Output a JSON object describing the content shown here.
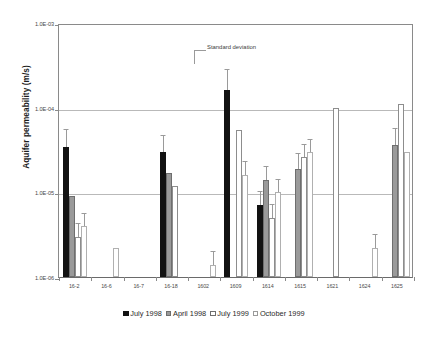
{
  "chart_data": {
    "type": "bar",
    "title": "",
    "xlabel": "",
    "ylabel": "Aquifer permeability (m/s)",
    "yscale": "log",
    "ylim": [
      1e-06,
      0.001
    ],
    "ytick_labels": [
      "1.0E-03",
      "1.0E-04",
      "1.0E-05",
      "1.0E-06"
    ],
    "ytick_values": [
      0.001,
      0.0001,
      1e-05,
      1e-06
    ],
    "grid": "horizontal",
    "legend_position": "bottom",
    "categories": [
      "16-2",
      "16-6",
      "16-7",
      "16-18",
      "1602",
      "1609",
      "1614",
      "1615",
      "1621",
      "1624",
      "1625"
    ],
    "series": [
      {
        "name": "July 1998",
        "color": "#121212",
        "values": [
          3.4e-05,
          null,
          null,
          3e-05,
          null,
          0.00016,
          7e-06,
          null,
          null,
          null,
          null
        ],
        "errors": [
          2e-05,
          null,
          null,
          1.6e-05,
          null,
          0.00012,
          3e-06,
          null,
          null,
          null,
          null
        ]
      },
      {
        "name": "April 1998",
        "color": "#9a9a9a",
        "values": [
          9e-06,
          null,
          null,
          1.7e-05,
          null,
          null,
          1.4e-05,
          1.9e-05,
          null,
          null,
          3.6e-05
        ],
        "errors": [
          null,
          null,
          null,
          null,
          null,
          null,
          6e-06,
          9e-06,
          null,
          null,
          2e-05
        ]
      },
      {
        "name": "July 1999",
        "color": "#ffffff",
        "values": [
          3e-06,
          null,
          null,
          1.2e-05,
          null,
          5.5e-05,
          5e-06,
          2.6e-05,
          0.0001,
          null,
          0.00011
        ],
        "errors": [
          1.2e-06,
          null,
          null,
          null,
          null,
          null,
          2e-06,
          1e-05,
          null,
          null,
          null
        ]
      },
      {
        "name": "October 1999",
        "color": "#ffffff",
        "values": [
          4e-06,
          2.2e-06,
          null,
          null,
          1.4e-06,
          1.6e-05,
          1e-05,
          3e-05,
          null,
          2.2e-06,
          3e-05
        ],
        "errors": [
          1.5e-06,
          null,
          null,
          null,
          6e-07,
          7e-06,
          4e-06,
          1.2e-05,
          null,
          9e-07,
          null
        ]
      }
    ],
    "annotations": [
      {
        "text": "Standard deviation",
        "points_to": "error-bar-of-1609-july-1998"
      }
    ]
  },
  "axis": {
    "y_title": "Aquifer permeability (m/s)"
  },
  "legend": {
    "items": [
      {
        "label": "July 1998"
      },
      {
        "label": "April 1998"
      },
      {
        "label": "July 1999"
      },
      {
        "label": "October 1999"
      }
    ]
  },
  "annotation": {
    "standard_deviation": "Standard deviation"
  }
}
